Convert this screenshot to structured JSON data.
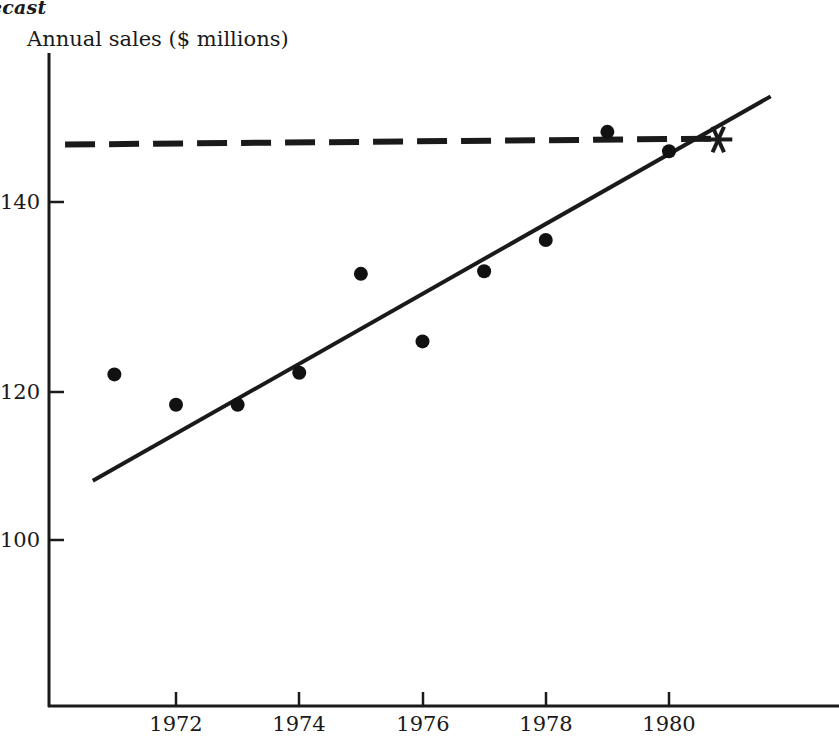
{
  "title": "ecast",
  "chart_data": {
    "type": "scatter",
    "title": "ecast",
    "ylabel": "Annual sales ($ millions)",
    "xlabel": "",
    "x": [
      1971,
      1972,
      1973,
      1974,
      1975,
      1976,
      1977,
      1978,
      1979,
      1980
    ],
    "values": [
      119.6,
      116.0,
      116.0,
      119.8,
      131.5,
      123.5,
      131.8,
      135.5,
      148.3,
      146.0
    ],
    "series": [
      {
        "name": "Annual sales",
        "values": [
          119.6,
          116.0,
          116.0,
          119.8,
          131.5,
          123.5,
          131.8,
          135.5,
          148.3,
          146.0
        ]
      }
    ],
    "xlim": [
      1970.2,
      1982.8
    ],
    "ylim": [
      92,
      154
    ],
    "xticks": [
      1972,
      1974,
      1976,
      1978,
      1980
    ],
    "xtick_labels": [
      "1972",
      "1974",
      "1976",
      "1978",
      "1980"
    ],
    "yticks": [
      100,
      120,
      140
    ],
    "ytick_labels": [
      "100",
      "120",
      "140"
    ],
    "grid": false,
    "legend": "none",
    "annotations": [
      {
        "name": "trend-line",
        "kind": "line",
        "style": "solid",
        "x_start": 1970.65,
        "y_start": 107.0,
        "x_end": 1981.65,
        "y_end": 152.5
      },
      {
        "name": "capacity-line",
        "kind": "line",
        "style": "dashed",
        "x_start": 1970.2,
        "y_start": 146.8,
        "x_end": 1980.8,
        "y_end": 147.5
      },
      {
        "name": "crossover-marker",
        "kind": "star",
        "x": 1980.8,
        "y": 147.4
      }
    ]
  },
  "axes": {
    "y_axis_name": "y-axis",
    "x_axis_name": "x-axis"
  }
}
